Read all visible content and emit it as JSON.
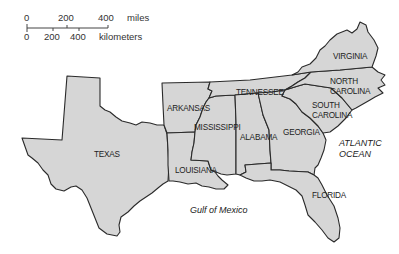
{
  "map": {
    "type": "regional-map",
    "region": "Southeastern United States",
    "fill_color": "#d6d6d6",
    "border_color": "#2a2a2a",
    "background_color": "#ffffff"
  },
  "scale_bar": {
    "miles": {
      "ticks": [
        "0",
        "200",
        "400"
      ],
      "unit": "miles"
    },
    "kilometers": {
      "ticks": [
        "0",
        "200",
        "400"
      ],
      "unit": "kilometers"
    }
  },
  "states": [
    {
      "name": "TEXAS"
    },
    {
      "name": "ARKANSAS"
    },
    {
      "name": "LOUISIANA"
    },
    {
      "name": "MISSISSIPPI"
    },
    {
      "name": "TENNESSEE"
    },
    {
      "name": "ALABAMA"
    },
    {
      "name": "GEORGIA"
    },
    {
      "name": "FLORIDA"
    },
    {
      "name": "SOUTH CAROLINA",
      "lines": [
        "SOUTH",
        "CAROLINA"
      ]
    },
    {
      "name": "NORTH CAROLINA",
      "lines": [
        "NORTH",
        "CAROLINA"
      ]
    },
    {
      "name": "VIRGINIA"
    }
  ],
  "water_bodies": [
    {
      "name": "Gulf of Mexico"
    },
    {
      "name": "ATLANTIC OCEAN",
      "lines": [
        "ATLANTIC",
        "OCEAN"
      ]
    }
  ]
}
